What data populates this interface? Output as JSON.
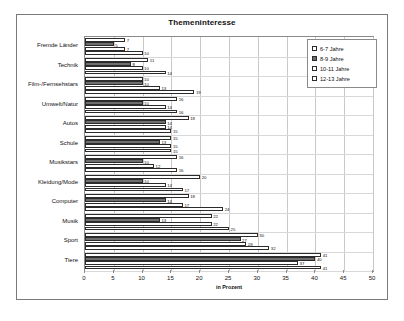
{
  "chart_data": {
    "type": "bar",
    "orientation": "horizontal",
    "title": "Themeninteresse",
    "xlabel": "in Prozent",
    "ylabel": "",
    "xlim": [
      0,
      50
    ],
    "xticks": [
      0,
      5,
      10,
      15,
      20,
      25,
      30,
      35,
      40,
      45,
      50
    ],
    "grid": true,
    "legend_position": "top-right",
    "categories": [
      "Fremde Länder",
      "Technik",
      "Film-/Fernsehstars",
      "Umwelt/Natur",
      "Autos",
      "Schule",
      "Musikstars",
      "Kleidung/Mode",
      "Computer",
      "Musik",
      "Sport",
      "Tiere"
    ],
    "series": [
      {
        "name": "6-7 Jahre",
        "values": [
          7,
          11,
          10,
          16,
          18,
          15,
          16,
          20,
          18,
          22,
          30,
          41
        ]
      },
      {
        "name": "8-9 Jahre",
        "values": [
          5,
          8,
          10,
          10,
          14,
          13,
          10,
          10,
          14,
          13,
          27,
          40
        ]
      },
      {
        "name": "10-11 Jahre",
        "values": [
          7,
          10,
          13,
          14,
          14,
          15,
          12,
          14,
          17,
          22,
          28,
          37
        ]
      },
      {
        "name": "12-13 Jahre",
        "values": [
          10,
          14,
          19,
          16,
          15,
          15,
          16,
          17,
          24,
          25,
          32,
          41
        ]
      }
    ],
    "extra_bar_labels": {
      "Computer": [
        null,
        null,
        null,
        29
      ],
      "Kleidung/Mode": [
        null,
        null,
        null,
        28
      ],
      "Musikstars": [
        null,
        null,
        null,
        25
      ],
      "Musik": [
        null,
        null,
        null,
        33
      ],
      "Sport": [
        null,
        null,
        null,
        33
      ]
    }
  },
  "legend": {
    "items": [
      {
        "label": "6-7 Jahre"
      },
      {
        "label": "8-9 Jahre"
      },
      {
        "label": "10-11 Jahre"
      },
      {
        "label": "12-13 Jahre"
      }
    ]
  }
}
